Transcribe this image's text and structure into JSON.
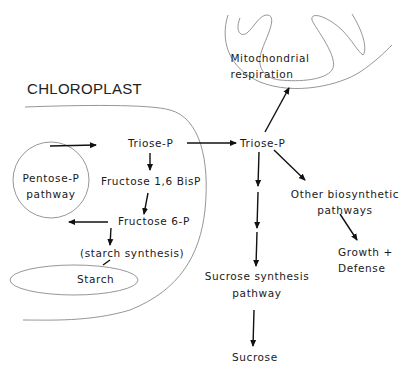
{
  "diagram": {
    "compartments": {
      "chloroplast": "CHLOROPLAST",
      "mitochondrion": [
        "Mitochondrial",
        "respiration"
      ]
    },
    "nodes": {
      "triose_p_chloroplast": "Triose-P",
      "fructose_bisp": "Fructose 1,6 BisP",
      "fructose_6p": "Fructose 6-P",
      "starch_synthesis": "(starch synthesis)",
      "starch": "Starch",
      "pentose_p": [
        "Pentose-P",
        "pathway"
      ],
      "triose_p_cytosol": "Triose-P",
      "other_biosynthetic": [
        "Other biosynthetic",
        "pathways"
      ],
      "growth_defense": [
        "Growth +",
        "Defense"
      ],
      "sucrose_synthesis": [
        "Sucrose synthesis",
        "pathway"
      ],
      "sucrose": "Sucrose"
    },
    "edges": [
      {
        "from": "pentose_p",
        "to": "triose_p_chloroplast"
      },
      {
        "from": "triose_p_chloroplast",
        "to": "fructose_bisp"
      },
      {
        "from": "fructose_bisp",
        "to": "fructose_6p"
      },
      {
        "from": "fructose_6p",
        "to": "pentose_p"
      },
      {
        "from": "fructose_6p",
        "to": "starch_synthesis"
      },
      {
        "from": "starch_synthesis",
        "to": "starch"
      },
      {
        "from": "triose_p_chloroplast",
        "to": "triose_p_cytosol"
      },
      {
        "from": "triose_p_cytosol",
        "to": "mitochondrion"
      },
      {
        "from": "triose_p_cytosol",
        "to": "other_biosynthetic"
      },
      {
        "from": "other_biosynthetic",
        "to": "growth_defense"
      },
      {
        "from": "triose_p_cytosol",
        "to": "sucrose_synthesis"
      },
      {
        "from": "sucrose_synthesis",
        "to": "sucrose"
      }
    ]
  }
}
